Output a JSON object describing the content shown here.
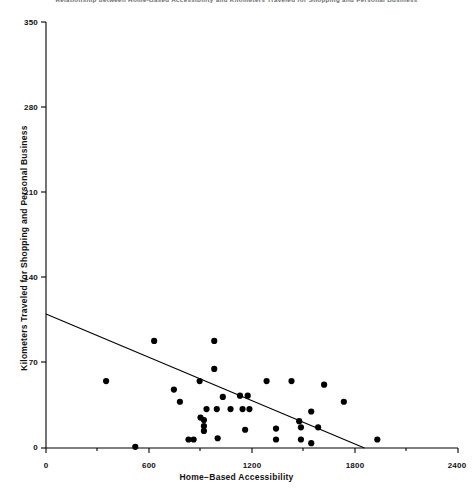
{
  "chart_data": {
    "type": "scatter",
    "title": "Relationship between Home-Based Accessibility and Kilometers Traveled for Shopping and Personal Business",
    "xlabel": "Home−Based Accessibility",
    "ylabel": "Kilometers Traveled for Shopping and Personal Business",
    "xlim": [
      0,
      2400
    ],
    "ylim": [
      0,
      350
    ],
    "xticks": [
      0,
      600,
      1200,
      1800,
      2400
    ],
    "yticks": [
      0,
      70,
      140,
      210,
      280,
      350
    ],
    "grid": false,
    "legend": null,
    "marker_color": "#000000",
    "line_color": "#000000",
    "background": "#ffffff",
    "points": [
      {
        "x": 350,
        "y": 55
      },
      {
        "x": 630,
        "y": 88
      },
      {
        "x": 980,
        "y": 88
      },
      {
        "x": 980,
        "y": 65
      },
      {
        "x": 745,
        "y": 48
      },
      {
        "x": 895,
        "y": 55
      },
      {
        "x": 1285,
        "y": 55
      },
      {
        "x": 1430,
        "y": 55
      },
      {
        "x": 780,
        "y": 38
      },
      {
        "x": 1030,
        "y": 42
      },
      {
        "x": 1130,
        "y": 43
      },
      {
        "x": 1175,
        "y": 43
      },
      {
        "x": 1620,
        "y": 52
      },
      {
        "x": 1735,
        "y": 38
      },
      {
        "x": 935,
        "y": 32
      },
      {
        "x": 995,
        "y": 32
      },
      {
        "x": 1075,
        "y": 32
      },
      {
        "x": 1145,
        "y": 32
      },
      {
        "x": 1185,
        "y": 32
      },
      {
        "x": 1545,
        "y": 30
      },
      {
        "x": 900,
        "y": 25
      },
      {
        "x": 920,
        "y": 23
      },
      {
        "x": 920,
        "y": 18
      },
      {
        "x": 920,
        "y": 14
      },
      {
        "x": 1475,
        "y": 22
      },
      {
        "x": 1485,
        "y": 17
      },
      {
        "x": 1585,
        "y": 17
      },
      {
        "x": 1160,
        "y": 15
      },
      {
        "x": 1340,
        "y": 16
      },
      {
        "x": 1340,
        "y": 7
      },
      {
        "x": 1485,
        "y": 7
      },
      {
        "x": 830,
        "y": 7
      },
      {
        "x": 860,
        "y": 7
      },
      {
        "x": 1000,
        "y": 8
      },
      {
        "x": 1545,
        "y": 4
      },
      {
        "x": 1930,
        "y": 7
      },
      {
        "x": 520,
        "y": 1
      }
    ],
    "trend_line": {
      "x0": 0,
      "y0": 110,
      "x1": 1855,
      "y1": 0
    }
  }
}
